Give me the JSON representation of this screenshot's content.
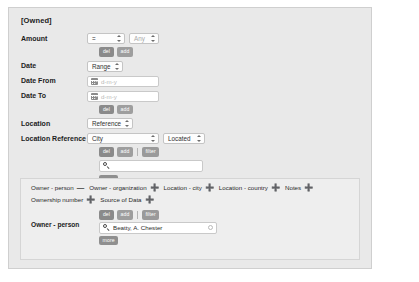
{
  "group": {
    "title": "[Owned]"
  },
  "criteria": {
    "amount": {
      "label": "Amount",
      "operator": "=",
      "value_placeholder": "Any",
      "buttons": [
        "del",
        "add"
      ]
    },
    "date": {
      "label": "Date",
      "mode": "Range"
    },
    "date_from": {
      "label": "Date From",
      "placeholder": "d-m-y",
      "icon": "calendar-icon"
    },
    "date_to": {
      "label": "Date To",
      "placeholder": "d-m-y",
      "icon": "calendar-icon",
      "buttons": [
        "del",
        "add"
      ]
    },
    "location": {
      "label": "Location",
      "mode": "Reference"
    },
    "location_reference": {
      "label": "Location Reference",
      "type": "City",
      "relation": "Located",
      "buttons": [
        "del",
        "add",
        "filter"
      ]
    },
    "search": {
      "icon": "search-icon",
      "value": "",
      "placeholder": ""
    },
    "more_label": "more"
  },
  "panel": {
    "chips_row1": [
      {
        "label": "Owner - person",
        "sign": "—"
      },
      {
        "label": "Owner - organization",
        "sign": "➕"
      },
      {
        "label": "Location - city",
        "sign": "➕"
      },
      {
        "label": "Location - country",
        "sign": "➕"
      },
      {
        "label": "Notes",
        "sign": "➕"
      }
    ],
    "chips_row2": [
      {
        "label": "Ownership number",
        "sign": "➕"
      },
      {
        "label": "Source of Data",
        "sign": "➕"
      }
    ],
    "owner": {
      "label": "Owner - person",
      "buttons": [
        "del",
        "add",
        "filter"
      ],
      "search_value": "Beatty, A. Chester",
      "search_icon": "search-icon",
      "clear_icon": "clear-icon",
      "more_label": "more"
    }
  },
  "buttons": {
    "del": "del",
    "add": "add",
    "filter": "filter",
    "more": "more"
  },
  "colors": {
    "outer_bg": "#e9e9e9",
    "inner_bg": "#eeeeee",
    "button_gray": "#8f8f8f",
    "page_bg": "#ffffff"
  }
}
